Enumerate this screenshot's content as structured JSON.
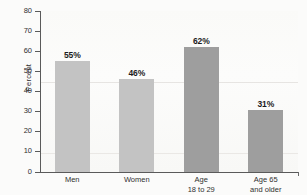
{
  "chart_data": {
    "type": "bar",
    "title": "",
    "subtitle": "",
    "xlabel": "",
    "ylabel": "Percent",
    "ylim": [
      0,
      80
    ],
    "yticks": [
      0,
      10,
      20,
      30,
      40,
      50,
      60,
      70,
      80
    ],
    "ytick_labels": [
      "0",
      "10",
      "20",
      "30",
      "40",
      "50",
      "60",
      "70",
      "80"
    ],
    "grid": false,
    "legend": "none",
    "categories": [
      "Men",
      "Women",
      "Age 18 to 29",
      "Age 65 and older"
    ],
    "category_lines": [
      [
        "Men",
        ""
      ],
      [
        "Women",
        ""
      ],
      [
        "Age",
        "18 to 29"
      ],
      [
        "Age 65",
        "and older"
      ]
    ],
    "values": [
      55,
      46,
      62,
      31
    ],
    "value_labels": [
      "55%",
      "46%",
      "62%",
      "31%"
    ],
    "bar_colors": [
      "#c3c3c3",
      "#c3c3c3",
      "#9e9e9e",
      "#9e9e9e"
    ],
    "series": [
      {
        "name": "Percent",
        "values": [
          55,
          46,
          62,
          31
        ]
      }
    ]
  },
  "axis": {
    "axis_line_color": "#5a5a5a",
    "text_color": "#2f2f2f"
  }
}
